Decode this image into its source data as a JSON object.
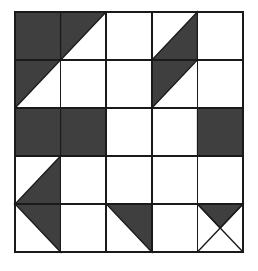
{
  "figure": {
    "canvas": {
      "width": 258,
      "height": 271
    },
    "background_color": "#ffffff"
  },
  "grid": {
    "rows": 5,
    "columns": 5,
    "origin_x": 15,
    "origin_y": 12,
    "cell_width": 45.6,
    "cell_height": 48.0,
    "line_color": "#1a1a1a",
    "line_width": 1.6,
    "border_width": 2.2
  },
  "palette": {
    "dark_fill": "#3f3f3f",
    "light_fill": "#ffffff",
    "outline": "#1a1a1a"
  },
  "legend": {
    "dark_label": "shaded patch",
    "light_label": "background patch"
  },
  "cells": [
    {
      "row": 1,
      "col": 1,
      "type": "full-dark",
      "name": "cell-r1c1-dark-square"
    },
    {
      "row": 1,
      "col": 2,
      "type": "triangle-ul",
      "name": "cell-r1c2-upper-left-triangle"
    },
    {
      "row": 1,
      "col": 3,
      "type": "blank",
      "name": "cell-r1c3-blank"
    },
    {
      "row": 1,
      "col": 4,
      "type": "triangle-lr",
      "name": "cell-r1c4-lower-right-triangle"
    },
    {
      "row": 1,
      "col": 5,
      "type": "blank",
      "name": "cell-r1c5-blank"
    },
    {
      "row": 2,
      "col": 1,
      "type": "triangle-ul",
      "name": "cell-r2c1-upper-left-triangle"
    },
    {
      "row": 2,
      "col": 2,
      "type": "blank",
      "name": "cell-r2c2-blank"
    },
    {
      "row": 2,
      "col": 3,
      "type": "blank",
      "name": "cell-r2c3-blank"
    },
    {
      "row": 2,
      "col": 4,
      "type": "triangle-ul",
      "name": "cell-r2c4-upper-left-triangle"
    },
    {
      "row": 2,
      "col": 5,
      "type": "blank",
      "name": "cell-r2c5-blank"
    },
    {
      "row": 3,
      "col": 1,
      "type": "full-dark",
      "name": "cell-r3c1-dark-square"
    },
    {
      "row": 3,
      "col": 2,
      "type": "full-dark",
      "name": "cell-r3c2-dark-square"
    },
    {
      "row": 3,
      "col": 3,
      "type": "blank",
      "name": "cell-r3c3-blank"
    },
    {
      "row": 3,
      "col": 4,
      "type": "blank",
      "name": "cell-r3c4-blank"
    },
    {
      "row": 3,
      "col": 5,
      "type": "full-dark",
      "name": "cell-r3c5-dark-square"
    },
    {
      "row": 4,
      "col": 1,
      "type": "triangle-lr",
      "name": "cell-r4c1-lower-right-triangle"
    },
    {
      "row": 4,
      "col": 2,
      "type": "blank",
      "name": "cell-r4c2-blank"
    },
    {
      "row": 4,
      "col": 3,
      "type": "blank",
      "name": "cell-r4c3-blank"
    },
    {
      "row": 4,
      "col": 4,
      "type": "blank",
      "name": "cell-r4c4-blank"
    },
    {
      "row": 4,
      "col": 5,
      "type": "blank",
      "name": "cell-r4c5-blank"
    },
    {
      "row": 5,
      "col": 1,
      "type": "triangle-ur",
      "name": "cell-r5c1-upper-right-triangle"
    },
    {
      "row": 5,
      "col": 2,
      "type": "blank",
      "name": "cell-r5c2-blank"
    },
    {
      "row": 5,
      "col": 3,
      "type": "triangle-ur",
      "name": "cell-r5c3-upper-right-triangle"
    },
    {
      "row": 5,
      "col": 4,
      "type": "blank",
      "name": "cell-r5c4-blank"
    },
    {
      "row": 5,
      "col": 5,
      "type": "hourglass-top",
      "name": "cell-r5c5-hourglass-top-dark"
    }
  ]
}
